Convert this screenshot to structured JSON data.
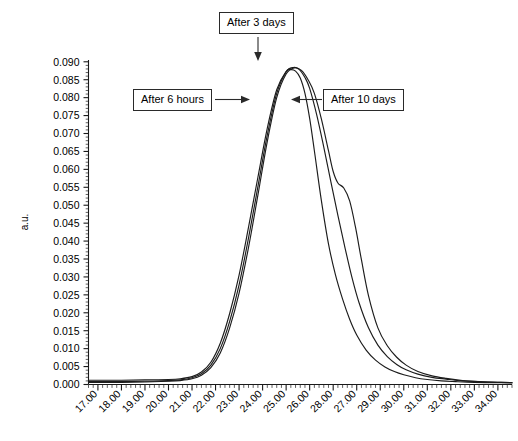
{
  "chart_data": {
    "type": "line",
    "title": "",
    "xlabel": "",
    "ylabel": "a.u.",
    "xlim": [
      16.6,
      34.6
    ],
    "ylim": [
      0.0,
      0.0905
    ],
    "grid": false,
    "legend_position": "none",
    "x_tick_labels": [
      "17.00",
      "18.00",
      "19.00",
      "20.00",
      "21.00",
      "22.00",
      "23.00",
      "24.00",
      "25.00",
      "26.00",
      "28.00",
      "27.00",
      "29.00",
      "30.00",
      "31.00",
      "32.00",
      "33.00",
      "34.00"
    ],
    "x_tick_values": [
      17,
      18,
      19,
      20,
      21,
      22,
      23,
      24,
      25,
      26,
      27,
      28,
      29,
      30,
      31,
      32,
      33,
      34
    ],
    "x_minor_ticks_per_interval": 5,
    "y_tick_labels": [
      "0.000",
      "0.005",
      "0.010",
      "0.015",
      "0.020",
      "0.025",
      "0.030",
      "0.035",
      "0.040",
      "0.045",
      "0.050",
      "0.055",
      "0.060",
      "0.065",
      "0.070",
      "0.075",
      "0.080",
      "0.085",
      "0.090"
    ],
    "y_tick_values": [
      0.0,
      0.005,
      0.01,
      0.015,
      0.02,
      0.025,
      0.03,
      0.035,
      0.04,
      0.045,
      0.05,
      0.055,
      0.06,
      0.065,
      0.07,
      0.075,
      0.08,
      0.085,
      0.09
    ],
    "y_minor_ticks_per_interval": 5,
    "series": [
      {
        "name": "After 6 hours",
        "color": "#1c1c1c",
        "x": [
          16.6,
          17.0,
          18.0,
          19.0,
          20.0,
          20.5,
          21.0,
          21.4,
          21.8,
          22.2,
          22.6,
          23.0,
          23.4,
          23.8,
          24.2,
          24.6,
          25.0,
          25.2,
          25.4,
          25.6,
          25.8,
          26.0,
          26.2,
          26.5,
          26.8,
          27.1,
          27.4,
          27.7,
          28.0,
          28.4,
          28.8,
          29.2,
          29.6,
          30.0,
          30.5,
          31.0,
          31.6,
          32.2,
          33.0,
          34.0,
          34.6
        ],
        "y": [
          0.0012,
          0.0012,
          0.0012,
          0.0013,
          0.0014,
          0.0016,
          0.0022,
          0.0035,
          0.0062,
          0.0115,
          0.0198,
          0.0305,
          0.0438,
          0.0578,
          0.0715,
          0.0822,
          0.0873,
          0.0878,
          0.0874,
          0.0855,
          0.0812,
          0.0742,
          0.0652,
          0.0512,
          0.0392,
          0.0305,
          0.0238,
          0.0182,
          0.0138,
          0.0096,
          0.0068,
          0.0049,
          0.0036,
          0.0027,
          0.0019,
          0.0014,
          0.001,
          0.0008,
          0.0006,
          0.0005,
          0.0005
        ]
      },
      {
        "name": "After 3 days",
        "color": "#1c1c1c",
        "x": [
          16.6,
          17.0,
          18.0,
          19.0,
          20.0,
          20.5,
          21.0,
          21.4,
          21.8,
          22.2,
          22.6,
          23.0,
          23.4,
          23.8,
          24.2,
          24.6,
          25.0,
          25.3,
          25.55,
          25.8,
          26.0,
          26.3,
          26.6,
          26.9,
          27.2,
          27.5,
          27.8,
          28.1,
          28.5,
          28.9,
          29.3,
          29.7,
          30.1,
          30.6,
          31.2,
          31.8,
          32.5,
          33.2,
          34.0,
          34.6
        ],
        "y": [
          0.0008,
          0.0008,
          0.0008,
          0.0009,
          0.0011,
          0.0013,
          0.0019,
          0.003,
          0.0054,
          0.01,
          0.0176,
          0.0278,
          0.0408,
          0.0552,
          0.0696,
          0.0812,
          0.0872,
          0.0884,
          0.0879,
          0.0856,
          0.0826,
          0.0752,
          0.0662,
          0.0566,
          0.0472,
          0.0382,
          0.0298,
          0.0228,
          0.0158,
          0.011,
          0.0078,
          0.0056,
          0.0041,
          0.0029,
          0.002,
          0.0015,
          0.001,
          0.0008,
          0.0006,
          0.0005
        ]
      },
      {
        "name": "After 10 days",
        "color": "#1c1c1c",
        "x": [
          16.6,
          17.0,
          18.0,
          19.0,
          20.0,
          20.5,
          21.0,
          21.4,
          21.8,
          22.2,
          22.6,
          23.0,
          23.4,
          23.8,
          24.2,
          24.6,
          25.0,
          25.35,
          25.65,
          25.95,
          26.2,
          26.5,
          26.8,
          27.0,
          27.2,
          27.45,
          27.7,
          27.95,
          28.2,
          28.5,
          28.9,
          29.3,
          29.7,
          30.1,
          30.6,
          31.2,
          31.8,
          32.5,
          33.2,
          34.0,
          34.6
        ],
        "y": [
          0.0006,
          0.0006,
          0.0006,
          0.0007,
          0.0009,
          0.0011,
          0.0016,
          0.0026,
          0.0047,
          0.0088,
          0.0158,
          0.0255,
          0.0382,
          0.0528,
          0.0678,
          0.08,
          0.0866,
          0.0883,
          0.0876,
          0.0848,
          0.0812,
          0.074,
          0.0652,
          0.0594,
          0.0562,
          0.0548,
          0.0512,
          0.0438,
          0.0348,
          0.0248,
          0.0158,
          0.0108,
          0.0076,
          0.0054,
          0.0036,
          0.0024,
          0.0017,
          0.0011,
          0.0008,
          0.0006,
          0.0005
        ]
      }
    ],
    "annotations": [
      {
        "label": "After 3 days",
        "target_series": "After 3 days",
        "arrow_direction": "down"
      },
      {
        "label": "After 6 hours",
        "target_series": "After 6 hours",
        "arrow_direction": "right"
      },
      {
        "label": "After 10 days",
        "target_series": "After 10 days",
        "arrow_direction": "left"
      }
    ],
    "peak_value": 0.0884,
    "peak_x": 25.3
  }
}
